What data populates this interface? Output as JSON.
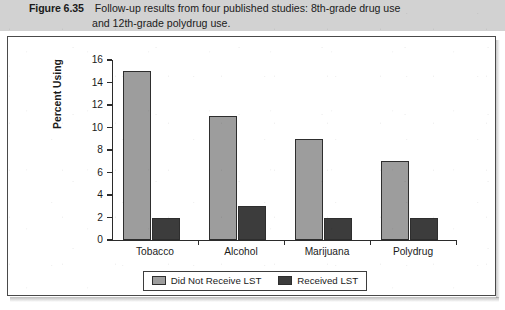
{
  "caption": {
    "figure_label": "Figure 6.35",
    "line1": "Follow-up results from four published studies: 8th-grade drug use",
    "line2": "and 12th-grade polydrug use."
  },
  "colors": {
    "caption_band": "#d2d2d2",
    "panel_border": "#4a4a4a",
    "axis": "#2b2b2b",
    "series_light": "#9d9d9d",
    "series_dark": "#3c3c3c",
    "page_background": "#ffffff"
  },
  "legend": {
    "position": "bottom-center",
    "items": [
      {
        "label": "Did Not Receive LST",
        "color": "#9d9d9d",
        "swatch": "light"
      },
      {
        "label": "Received LST",
        "color": "#3c3c3c",
        "swatch": "dark"
      }
    ]
  },
  "chart_data": {
    "type": "bar",
    "title": "",
    "xlabel": "",
    "ylabel": "Percent Using",
    "categories": [
      "Tobacco",
      "Alcohol",
      "Marijuana",
      "Polydrug"
    ],
    "series": [
      {
        "name": "Did Not Receive LST",
        "color": "#9d9d9d",
        "values": [
          15,
          11,
          9,
          7
        ]
      },
      {
        "name": "Received LST",
        "color": "#3c3c3c",
        "values": [
          2,
          3,
          2,
          2
        ]
      }
    ],
    "ylim": [
      0,
      16
    ],
    "ytick_values": [
      0,
      2,
      4,
      6,
      8,
      10,
      12,
      14,
      16
    ],
    "ytick_labels": [
      "0",
      "2",
      "4",
      "6",
      "8",
      "10",
      "12",
      "14",
      "16"
    ],
    "grid": false,
    "legend_position": "bottom-center"
  }
}
